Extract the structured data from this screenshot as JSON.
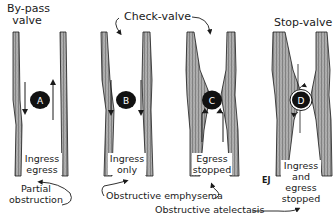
{
  "diagram": {
    "type": "airway-obstruction-valve-mechanisms",
    "headings": {
      "bypass": "By-pass\nvalve",
      "bypass_line1": "By-pass",
      "bypass_line2": "valve",
      "check": "Check-valve",
      "stop": "Stop-valve"
    },
    "panels": [
      {
        "id": "A",
        "letter": "A",
        "caption_line1": "Ingress",
        "caption_line2": "egress",
        "caption_line3": ""
      },
      {
        "id": "B",
        "letter": "B",
        "caption_line1": "Ingress",
        "caption_line2": "only",
        "caption_line3": ""
      },
      {
        "id": "C",
        "letter": "C",
        "caption_line1": "Egress",
        "caption_line2": "stopped",
        "caption_line3": ""
      },
      {
        "id": "D",
        "letter": "D",
        "caption_line1": "Ingress",
        "caption_line2": "and",
        "caption_line3": "egress",
        "caption_line4": "stopped"
      }
    ],
    "bottom_labels": {
      "partial_line1": "Partial",
      "partial_line2": "obstruction",
      "emphysema": "Obstructive emphysema",
      "atelectasis": "Obstructive atelectasis"
    },
    "corner_mark": "EJ",
    "colors": {
      "ink": "#1a1a1a",
      "wall_fill": "#8a8a8a",
      "background": "#ffffff"
    }
  }
}
